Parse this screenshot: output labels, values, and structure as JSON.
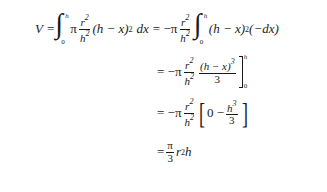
{
  "equation": {
    "line1": {
      "lhs": "V",
      "eq": "=",
      "integral": {
        "upper": "h",
        "lower": "0"
      },
      "pi": "π",
      "frac": {
        "num": "r",
        "num_exp": "2",
        "den": "h",
        "den_exp": "2"
      },
      "paren": "(h − x)",
      "paren_exp": "2",
      "dx": "dx",
      "eq2": "= −π",
      "frac2": {
        "num": "r",
        "num_exp": "2",
        "den": "h",
        "den_exp": "2"
      },
      "integral2": {
        "upper": "h",
        "lower": "0"
      },
      "paren2": "(h − x)",
      "paren2_exp": "2",
      "tail": "(−dx)"
    },
    "line2": {
      "eq": "= −π",
      "frac": {
        "num": "r",
        "num_exp": "2",
        "den": "h",
        "den_exp": "2"
      },
      "frac2": {
        "num": "(h − x)",
        "num_exp": "3",
        "den": "3"
      },
      "eval": {
        "upper": "h",
        "lower": "0"
      }
    },
    "line3": {
      "eq": "= −π",
      "frac": {
        "num": "r",
        "num_exp": "2",
        "den": "h",
        "den_exp": "2"
      },
      "bracket_open": "[",
      "inner": "0 −",
      "frac2": {
        "num": "h",
        "num_exp": "3",
        "den": "3"
      },
      "bracket_close": "]"
    },
    "line4": {
      "eq": "=",
      "frac": {
        "num": "π",
        "den": "3"
      },
      "tail": "r",
      "tail_exp": "2",
      "tail2": "h"
    }
  }
}
